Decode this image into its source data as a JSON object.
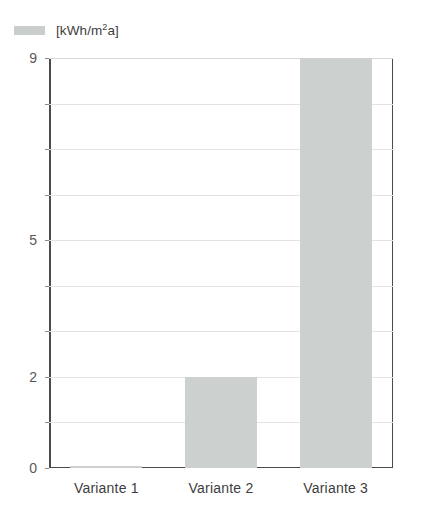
{
  "legend": {
    "swatch_name": "legend-color-swatch",
    "label_prefix": "[kWh/m",
    "label_sup": "2",
    "label_suffix": "a]",
    "full_label": "[kWh/m2a]",
    "color": "#ccd1d0"
  },
  "axis": {
    "y_tick_labels": [
      "9",
      "5",
      "2",
      "0"
    ],
    "y_tick_values": [
      9,
      5,
      2,
      0
    ],
    "x_labels": [
      "Variante 1",
      "Variante 2",
      "Variante 3"
    ]
  },
  "chart_data": {
    "type": "bar",
    "title": "",
    "subtitle": "",
    "xlabel": "",
    "ylabel": "[kWh/m2a]",
    "categories": [
      "Variante 1",
      "Variante 2",
      "Variante 3"
    ],
    "values": [
      0,
      2,
      9
    ],
    "series": [
      {
        "name": "[kWh/m2a]",
        "color": "#ccd1d0",
        "values": [
          0,
          2,
          9
        ]
      }
    ],
    "ylim": [
      0,
      9
    ],
    "yticks_labeled": [
      0,
      2,
      5,
      9
    ],
    "gridlines_at": [
      1,
      2,
      3,
      4,
      5,
      6,
      7,
      8,
      9
    ],
    "grid": true,
    "legend": true,
    "legend_position": "top-left",
    "legend_entries": [
      "[kWh/m2a]"
    ],
    "annotations": []
  },
  "colors": {
    "bar_fill": "#ccd1d0",
    "axis_line": "#4b4b4b",
    "gridline": "#e3e3e3",
    "text": "#3d3d3d",
    "background": "#ffffff"
  }
}
